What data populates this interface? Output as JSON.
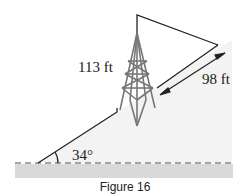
{
  "figure": {
    "caption": "Figure 16",
    "labels": {
      "tower_height": "113 ft",
      "slope_distance": "98 ft",
      "slope_angle": "34°"
    },
    "colors": {
      "line": "#222222",
      "tower": "#777777",
      "hill_fill": "#f3f3f3",
      "ground_band": "#d9d9d9",
      "dash": "#888888"
    }
  }
}
